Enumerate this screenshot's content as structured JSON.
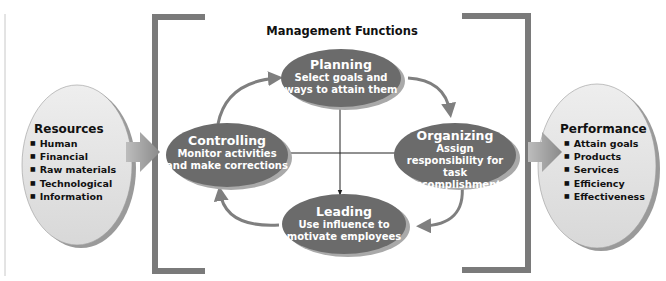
{
  "diagram": {
    "title": "Management Functions",
    "colors": {
      "node_fill": "#6b6b6b",
      "node_shadow": "#a9a9a9",
      "side_fill": "#e4e4e4",
      "bracket": "#7a7a7a",
      "arrow": "#7f7f7f",
      "text_dark": "#111111",
      "text_light": "#ffffff"
    },
    "resources": {
      "title": "Resources",
      "items": [
        "Human",
        "Financial",
        "Raw materials",
        "Technological",
        "Information"
      ]
    },
    "performance": {
      "title": "Performance",
      "items": [
        "Attain goals",
        "Products",
        "Services",
        "Efficiency",
        "Effectiveness"
      ]
    },
    "functions": {
      "planning": {
        "name": "Planning",
        "line1": "Select goals and",
        "line2": "ways to attain them",
        "line3": ""
      },
      "organizing": {
        "name": "Organizing",
        "line1": "Assign",
        "line2": "responsibility for task",
        "line3": "accomplishment"
      },
      "leading": {
        "name": "Leading",
        "line1": "Use influence to",
        "line2": "motivate employees",
        "line3": ""
      },
      "controlling": {
        "name": "Controlling",
        "line1": "Monitor activities",
        "line2": "and make corrections",
        "line3": ""
      }
    },
    "flow": [
      "Planning",
      "Organizing",
      "Leading",
      "Controlling",
      "Planning"
    ]
  }
}
